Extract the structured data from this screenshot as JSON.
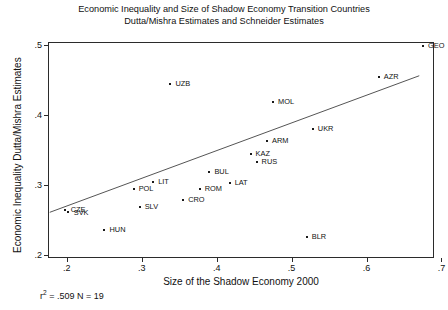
{
  "chart_data": {
    "type": "scatter",
    "title": "Economic Inequality and Size of Shadow Economy Transition Countries",
    "subtitle": "Dutta/Mishra Estimates and Schneider Estimates",
    "xlabel": "Size of the Shadow Economy 2000",
    "ylabel": "Economic Inequality Dutta/Mishra Estimates",
    "xlim": [
      0.175,
      0.69
    ],
    "ylim": [
      0.195,
      0.505
    ],
    "xticks": [
      0.2,
      0.3,
      0.4,
      0.5,
      0.6,
      0.7
    ],
    "xticklabels": [
      ".2",
      ".3",
      ".4",
      ".5",
      ".6",
      ".7"
    ],
    "yticks": [
      0.2,
      0.3,
      0.4,
      0.5
    ],
    "yticklabels": [
      ".2",
      ".3",
      ".4",
      ".5"
    ],
    "grid": false,
    "legend": null,
    "points": [
      {
        "label": "CZE",
        "x": 0.196,
        "y": 0.266,
        "lx": 6,
        "ly": 0
      },
      {
        "label": "SVK",
        "x": 0.2,
        "y": 0.263,
        "lx": 6,
        "ly": 1
      },
      {
        "label": "HUN",
        "x": 0.249,
        "y": 0.236,
        "lx": 5,
        "ly": 0
      },
      {
        "label": "POL",
        "x": 0.288,
        "y": 0.296,
        "lx": 5,
        "ly": 0
      },
      {
        "label": "SLV",
        "x": 0.296,
        "y": 0.27,
        "lx": 5,
        "ly": 0
      },
      {
        "label": "LIT",
        "x": 0.314,
        "y": 0.306,
        "lx": 5,
        "ly": 0
      },
      {
        "label": "UZB",
        "x": 0.337,
        "y": 0.446,
        "lx": 5,
        "ly": 0
      },
      {
        "label": "CRO",
        "x": 0.354,
        "y": 0.28,
        "lx": 5,
        "ly": 0
      },
      {
        "label": "ROM",
        "x": 0.376,
        "y": 0.295,
        "lx": 5,
        "ly": 0
      },
      {
        "label": "BUL",
        "x": 0.389,
        "y": 0.32,
        "lx": 5,
        "ly": 0
      },
      {
        "label": "LAT",
        "x": 0.416,
        "y": 0.304,
        "lx": 5,
        "ly": 0
      },
      {
        "label": "KAZ",
        "x": 0.444,
        "y": 0.346,
        "lx": 5,
        "ly": 0
      },
      {
        "label": "RUS",
        "x": 0.452,
        "y": 0.334,
        "lx": 5,
        "ly": 0
      },
      {
        "label": "ARM",
        "x": 0.466,
        "y": 0.364,
        "lx": 5,
        "ly": 0
      },
      {
        "label": "MOL",
        "x": 0.474,
        "y": 0.421,
        "lx": 5,
        "ly": 0
      },
      {
        "label": "BLR",
        "x": 0.519,
        "y": 0.226,
        "lx": 5,
        "ly": 0
      },
      {
        "label": "UKR",
        "x": 0.527,
        "y": 0.381,
        "lx": 5,
        "ly": 0
      },
      {
        "label": "AZR",
        "x": 0.615,
        "y": 0.456,
        "lx": 5,
        "ly": 0
      },
      {
        "label": "GEO",
        "x": 0.674,
        "y": 0.5,
        "lx": 5,
        "ly": 0
      }
    ],
    "fit_line": {
      "x0": 0.176,
      "y0": 0.262,
      "x1": 0.669,
      "y1": 0.458
    },
    "annotation": {
      "r2_prefix": "r",
      "r2_sup": "2",
      "r2_text": " = .509 N = 19"
    }
  }
}
